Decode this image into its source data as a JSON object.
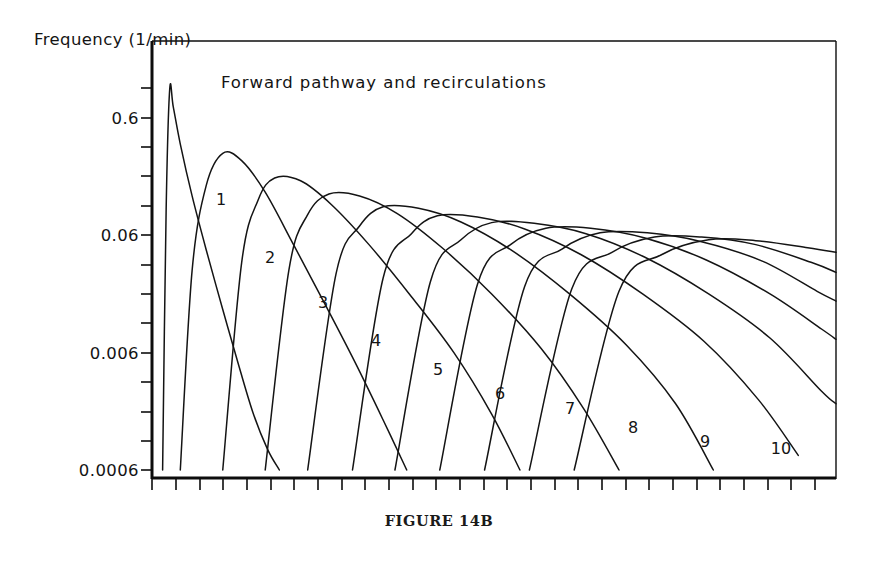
{
  "figure": {
    "caption": "FIGURE 14B",
    "title": "Forward pathway and recirculations",
    "y_axis_title": "Frequency (1/min)"
  },
  "chart_data": {
    "type": "line",
    "title": "Forward pathway and recirculations",
    "xlabel": "",
    "ylabel": "Frequency (1/min)",
    "y_scale": "log",
    "ylim": [
      0.0006,
      1.2
    ],
    "xlim": [
      0,
      29
    ],
    "grid": false,
    "legend": "inline-curve-labels",
    "y_tick_labels": [
      "0.6",
      "0.06",
      "0.006",
      "0.0006"
    ],
    "y_tick_values": [
      0.6,
      0.06,
      0.006,
      0.0006
    ],
    "x_tick_count": 29,
    "x_tick_labels": [],
    "annotations": [
      "1",
      "2",
      "3",
      "4",
      "5",
      "6",
      "7",
      "8",
      "9",
      "10"
    ],
    "series": [
      {
        "name": "forward pathway",
        "label": "",
        "peak_x": 0.75,
        "peak_y": 1.05,
        "x": [
          0.45,
          0.6,
          0.75,
          0.9,
          1.2,
          1.7,
          2.3,
          3.0,
          3.7,
          4.3,
          4.9,
          5.4
        ],
        "y": [
          0.0006,
          0.1,
          1.05,
          0.75,
          0.36,
          0.13,
          0.045,
          0.014,
          0.0045,
          0.0018,
          0.0009,
          0.0006
        ]
      },
      {
        "name": "recirculation 1",
        "label": "1",
        "peak_x": 3.0,
        "peak_y": 0.3,
        "x": [
          1.2,
          1.7,
          2.3,
          3.0,
          3.8,
          4.8,
          6.0,
          7.3,
          8.6,
          9.8,
          10.8
        ],
        "y": [
          0.0006,
          0.03,
          0.16,
          0.3,
          0.26,
          0.14,
          0.05,
          0.016,
          0.005,
          0.0016,
          0.0006
        ]
      },
      {
        "name": "recirculation 2",
        "label": "2",
        "peak_x": 5.2,
        "peak_y": 0.185,
        "x": [
          3.0,
          3.8,
          4.5,
          5.2,
          6.3,
          7.6,
          9.2,
          11.0,
          12.8,
          14.4,
          15.6
        ],
        "y": [
          0.0006,
          0.035,
          0.12,
          0.185,
          0.175,
          0.11,
          0.05,
          0.018,
          0.006,
          0.0018,
          0.0006
        ]
      },
      {
        "name": "recirculation 3",
        "label": "3",
        "peak_x": 7.5,
        "peak_y": 0.135,
        "x": [
          4.8,
          5.8,
          6.6,
          7.5,
          8.8,
          10.4,
          12.3,
          14.4,
          16.5,
          18.3,
          19.8
        ],
        "y": [
          0.0006,
          0.03,
          0.09,
          0.135,
          0.13,
          0.092,
          0.047,
          0.019,
          0.0065,
          0.002,
          0.0006
        ]
      },
      {
        "name": "recirculation 4",
        "label": "4",
        "peak_x": 9.8,
        "peak_y": 0.105,
        "x": [
          6.6,
          7.8,
          8.8,
          9.8,
          11.3,
          13.1,
          15.3,
          17.7,
          20.1,
          22.2,
          23.8
        ],
        "y": [
          0.0006,
          0.028,
          0.072,
          0.105,
          0.102,
          0.078,
          0.044,
          0.019,
          0.007,
          0.0022,
          0.0006
        ]
      },
      {
        "name": "recirculation 5",
        "label": "5",
        "peak_x": 12.1,
        "peak_y": 0.088,
        "x": [
          8.5,
          9.8,
          11.0,
          12.1,
          13.8,
          15.8,
          18.2,
          20.8,
          23.4,
          25.7,
          27.4
        ],
        "y": [
          0.0006,
          0.026,
          0.062,
          0.088,
          0.086,
          0.068,
          0.041,
          0.019,
          0.0075,
          0.0024,
          0.0008
        ]
      },
      {
        "name": "recirculation 6",
        "label": "6",
        "peak_x": 14.4,
        "peak_y": 0.077,
        "x": [
          10.3,
          11.8,
          13.1,
          14.4,
          16.2,
          18.4,
          20.9,
          23.6,
          26.2,
          28.4,
          29.0
        ],
        "y": [
          0.0006,
          0.024,
          0.055,
          0.077,
          0.076,
          0.062,
          0.039,
          0.019,
          0.008,
          0.0028,
          0.0022
        ]
      },
      {
        "name": "recirculation 7",
        "label": "7",
        "peak_x": 16.7,
        "peak_y": 0.069,
        "x": [
          12.2,
          13.8,
          15.2,
          16.7,
          18.6,
          20.9,
          23.5,
          26.2,
          28.4,
          29.0
        ],
        "y": [
          0.0006,
          0.023,
          0.05,
          0.069,
          0.069,
          0.057,
          0.037,
          0.019,
          0.0095,
          0.0078
        ]
      },
      {
        "name": "recirculation 8",
        "label": "8",
        "peak_x": 19.0,
        "peak_y": 0.063,
        "x": [
          14.1,
          15.8,
          17.4,
          19.0,
          21.0,
          23.3,
          25.9,
          28.2,
          29.0
        ],
        "y": [
          0.0006,
          0.022,
          0.046,
          0.063,
          0.063,
          0.053,
          0.036,
          0.02,
          0.0165
        ]
      },
      {
        "name": "recirculation 9",
        "label": "9",
        "peak_x": 21.3,
        "peak_y": 0.058,
        "x": [
          16.0,
          17.8,
          19.5,
          21.3,
          23.3,
          25.6,
          28.0,
          29.0
        ],
        "y": [
          0.0006,
          0.021,
          0.043,
          0.058,
          0.058,
          0.05,
          0.035,
          0.029
        ]
      },
      {
        "name": "recirculation 10",
        "label": "10",
        "peak_x": 23.6,
        "peak_y": 0.055,
        "x": [
          17.9,
          19.8,
          21.6,
          23.6,
          25.6,
          27.8,
          29.0
        ],
        "y": [
          0.0006,
          0.02,
          0.041,
          0.055,
          0.054,
          0.047,
          0.043
        ]
      }
    ]
  },
  "y_ticks": [
    {
      "label": "0.6",
      "y": 118
    },
    {
      "label": "0.06",
      "y": 235
    },
    {
      "label": "0.006",
      "y": 353
    },
    {
      "label": "0.0006",
      "y": 470
    }
  ],
  "curve_labels": [
    {
      "text": "1",
      "x": 221,
      "y": 199
    },
    {
      "text": "2",
      "x": 270,
      "y": 257
    },
    {
      "text": "3",
      "x": 323,
      "y": 302
    },
    {
      "text": "4",
      "x": 376,
      "y": 340
    },
    {
      "text": "5",
      "x": 438,
      "y": 369
    },
    {
      "text": "6",
      "x": 500,
      "y": 393
    },
    {
      "text": "7",
      "x": 570,
      "y": 408
    },
    {
      "text": "8",
      "x": 633,
      "y": 427
    },
    {
      "text": "9",
      "x": 705,
      "y": 441
    },
    {
      "text": "10",
      "x": 781,
      "y": 448
    }
  ],
  "colors": {
    "ink": "#141414",
    "axis": "#0d0d0d",
    "background": "#ffffff"
  }
}
